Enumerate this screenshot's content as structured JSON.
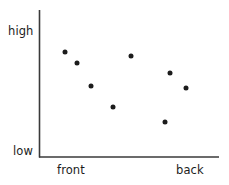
{
  "chart_data": {
    "type": "scatter",
    "title": "",
    "xlabel": "",
    "ylabel": "",
    "grid": false,
    "legend": null,
    "x_axis": {
      "tick_labels": [
        "front",
        "back"
      ],
      "tick_positions": [
        1,
        7
      ],
      "range": [
        0,
        8
      ]
    },
    "y_axis": {
      "tick_labels": [
        "low",
        "high"
      ],
      "tick_positions": [
        0,
        10
      ],
      "range": [
        0,
        11
      ]
    },
    "points": [
      {
        "x": 1.05,
        "y": 7.8,
        "px": 65,
        "py": 52
      },
      {
        "x": 1.75,
        "y": 7.1,
        "px": 77,
        "py": 63
      },
      {
        "x": 2.55,
        "y": 5.65,
        "px": 91,
        "py": 86
      },
      {
        "x": 3.85,
        "y": 4.35,
        "px": 113,
        "py": 107
      },
      {
        "x": 4.9,
        "y": 7.55,
        "px": 131,
        "py": 56
      },
      {
        "x": 7.2,
        "y": 6.5,
        "px": 170,
        "py": 73
      },
      {
        "x": 8.15,
        "y": 5.55,
        "px": 186,
        "py": 88
      },
      {
        "x": 6.9,
        "y": 3.4,
        "px": 165,
        "py": 122
      }
    ],
    "marker": {
      "shape": "circle",
      "color": "#1c1c1c",
      "size_px": 5
    },
    "axes": {
      "color": "#3a3a3a",
      "line_width": 1.6,
      "origin_px": [
        39,
        157
      ],
      "y_top_px": 10,
      "x_right_px": 219
    }
  },
  "labels": {
    "y_high": "high",
    "y_low": "low",
    "x_front": "front",
    "x_back": "back"
  }
}
